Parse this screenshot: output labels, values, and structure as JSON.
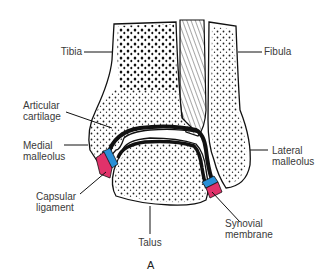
{
  "figure": {
    "panel_label": "A",
    "colors": {
      "outline": "#111111",
      "cartilage": "#111111",
      "synovial_membrane": "#2a8fd6",
      "capsular_ligament": "#e0326a",
      "background": "#ffffff"
    }
  },
  "labels": {
    "tibia": "Tibia",
    "fibula": "Fibula",
    "articular_cartilage_line1": "Articular",
    "articular_cartilage_line2": "cartilage",
    "medial_malleolus_line1": "Medial",
    "medial_malleolus_line2": "malleolus",
    "lateral_malleolus_line1": "Lateral",
    "lateral_malleolus_line2": "malleolus",
    "capsular_ligament_line1": "Capsular",
    "capsular_ligament_line2": "ligament",
    "synovial_membrane_line1": "Synovial",
    "synovial_membrane_line2": "membrane",
    "talus": "Talus"
  }
}
